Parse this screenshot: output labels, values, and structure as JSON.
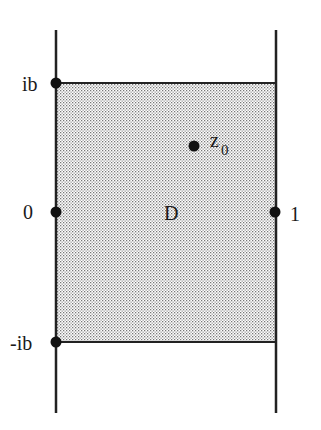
{
  "diagram": {
    "region_label": "D",
    "point_label": "z",
    "point_subscript": "0",
    "labels": {
      "top_left": "ib",
      "mid_left": "0",
      "bottom_left": "-ib",
      "mid_right": "1"
    },
    "colors": {
      "line": "#222222",
      "fill_dot": "#777777",
      "background": "#ffffff"
    }
  }
}
